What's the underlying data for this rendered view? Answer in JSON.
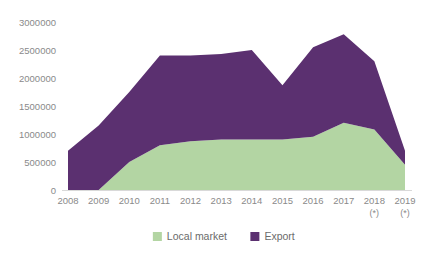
{
  "chart_data": {
    "type": "area",
    "stacked": true,
    "title": "",
    "subtitle": "",
    "xlabel": "",
    "ylabel": "",
    "x": [
      "2008",
      "2009",
      "2010",
      "2011",
      "2012",
      "2013",
      "2014",
      "2015",
      "2016",
      "2017",
      "2018",
      "2019"
    ],
    "x_tick_notes": [
      "",
      "",
      "",
      "",
      "",
      "",
      "",
      "",
      "",
      "",
      "(*)",
      "(*)"
    ],
    "categories": [
      "2008",
      "2009",
      "2010",
      "2011",
      "2012",
      "2013",
      "2014",
      "2015",
      "2016",
      "2017",
      "2018",
      "2019"
    ],
    "series": [
      {
        "name": "Local market",
        "color": "#b3d5a3",
        "values": [
          0,
          0,
          500000,
          800000,
          870000,
          900000,
          900000,
          900000,
          950000,
          1200000,
          1080000,
          450000
        ]
      },
      {
        "name": "Export",
        "color": "#5b3070",
        "values": [
          700000,
          1150000,
          1250000,
          1600000,
          1530000,
          1530000,
          1600000,
          970000,
          1600000,
          1580000,
          1220000,
          250000
        ]
      }
    ],
    "totals": [
      700000,
      1150000,
      1750000,
      2400000,
      2400000,
      2430000,
      2500000,
      1870000,
      2550000,
      2780000,
      2300000,
      700000
    ],
    "ylim": [
      0,
      3000000
    ],
    "y_ticks": [
      0,
      500000,
      1000000,
      1500000,
      2000000,
      2500000,
      3000000
    ],
    "y_tick_labels": [
      "0",
      "500000",
      "1000000",
      "1500000",
      "2000000",
      "2500000",
      "3000000"
    ],
    "grid": false,
    "legend_position": "bottom",
    "legend": [
      {
        "label": "Local market",
        "color": "#b3d5a3"
      },
      {
        "label": "Export",
        "color": "#5b3070"
      }
    ]
  },
  "colors": {
    "local_market": "#b3d5a3",
    "export": "#5b3070",
    "axis": "#d9d9d9",
    "tick_text": "#8a8a8a",
    "legend_text": "#6b6b6b",
    "background": "#ffffff"
  }
}
